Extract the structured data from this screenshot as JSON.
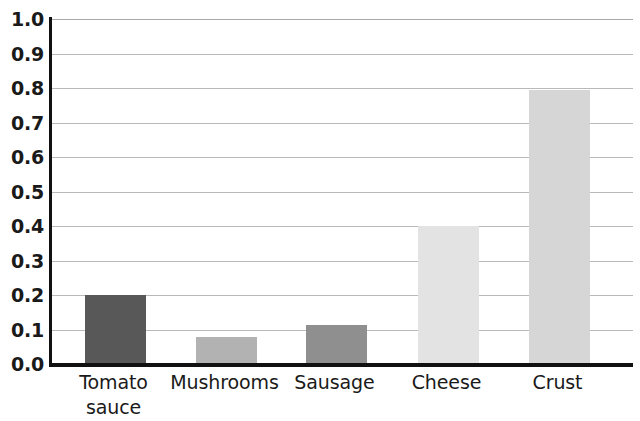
{
  "chart_data": {
    "type": "bar",
    "title": "",
    "subtitle": "",
    "xlabel": "",
    "ylabel": "",
    "categories": [
      "Tomato\nsauce",
      "Mushrooms",
      "Sausage",
      "Cheese",
      "Crust"
    ],
    "values": [
      0.2,
      0.078,
      0.113,
      0.4,
      0.795
    ],
    "bar_colors": [
      "#585858",
      "#b2b2b2",
      "#8f8f8f",
      "#e3e3e3",
      "#d6d6d6"
    ],
    "ylim": [
      0.0,
      1.0
    ],
    "ytick_labels": [
      "1.0",
      "0.9",
      "0.8",
      "0.7",
      "0.6",
      "0.5",
      "0.4",
      "0.3",
      "0.2",
      "0.1",
      "0.0"
    ],
    "ytick_values": [
      1.0,
      0.9,
      0.8,
      0.7,
      0.6,
      0.5,
      0.4,
      0.3,
      0.2,
      0.1,
      0.0
    ],
    "grid": true,
    "grid_axis": "y",
    "legend": false,
    "legend_position": "none",
    "axis_color": "#111111",
    "grid_color": "#b9b9b9",
    "background": "#ffffff"
  }
}
